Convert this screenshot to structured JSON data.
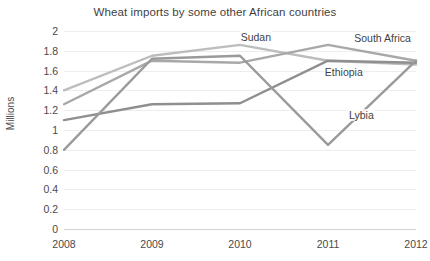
{
  "chart_data": {
    "type": "line",
    "title": "Wheat imports by some other African countries",
    "xlabel": "",
    "ylabel": "Millions",
    "categories": [
      "2008",
      "2009",
      "2010",
      "2011",
      "2012"
    ],
    "ylim": [
      0,
      2
    ],
    "ytick_values": [
      2,
      1.8,
      1.6,
      1.4,
      1.2,
      1,
      0.8,
      0.6,
      0.4,
      0.2,
      0
    ],
    "ytick_labels": [
      "2",
      "1.8",
      "1.6",
      "1.4",
      "1.2",
      "1",
      "0.8",
      "0.6",
      "0.4",
      "0.2",
      "0"
    ],
    "grid": true,
    "legend_position": "inline-labels",
    "series": [
      {
        "name": "Sudan",
        "color": "#bdbdbd",
        "values": [
          1.4,
          1.75,
          1.86,
          1.7,
          1.66
        ]
      },
      {
        "name": "South Africa",
        "color": "#a8a8a8",
        "values": [
          1.26,
          1.7,
          1.68,
          1.86,
          1.7
        ]
      },
      {
        "name": "Ethiopia",
        "color": "#8f8f8f",
        "values": [
          1.1,
          1.26,
          1.27,
          1.7,
          1.68
        ]
      },
      {
        "name": "Lybia",
        "color": "#9a9a9a",
        "values": [
          0.8,
          1.72,
          1.75,
          0.85,
          1.7
        ]
      }
    ],
    "annotations": [
      {
        "text": "Sudan",
        "x_frac": 0.545,
        "y_value": 1.935
      },
      {
        "text": "South Africa",
        "x_frac": 0.905,
        "y_value": 1.925
      },
      {
        "text": "Ethiopia",
        "x_frac": 0.795,
        "y_value": 1.585
      },
      {
        "text": "Lybia",
        "x_frac": 0.845,
        "y_value": 1.155
      }
    ]
  }
}
